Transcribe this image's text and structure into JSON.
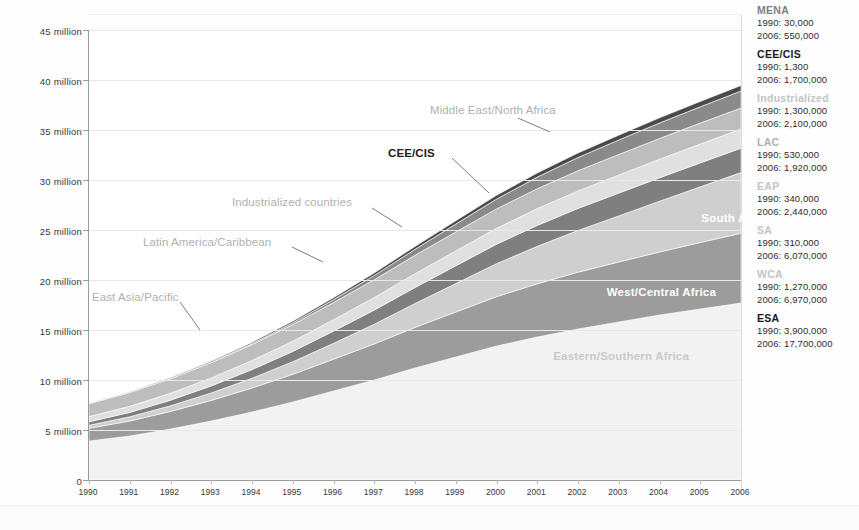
{
  "title": "",
  "chart_data": {
    "type": "area",
    "title": "",
    "xlabel": "",
    "ylabel": "",
    "stacked": true,
    "grid": true,
    "legend_position": "right",
    "ylim": [
      0,
      45000000
    ],
    "ytick_labels": [
      "0",
      "5 million",
      "10 million",
      "15 million",
      "20 million",
      "25 million",
      "30 million",
      "35 million",
      "40 million",
      "45 million"
    ],
    "ytick_values": [
      0,
      5000000,
      10000000,
      15000000,
      20000000,
      25000000,
      30000000,
      35000000,
      40000000,
      45000000
    ],
    "categories": [
      "1990",
      "1991",
      "1992",
      "1993",
      "1994",
      "1995",
      "1996",
      "1997",
      "1998",
      "1999",
      "2000",
      "2001",
      "2002",
      "2003",
      "2004",
      "2005",
      "2006"
    ],
    "series": [
      {
        "name": "Eastern/Southern Africa",
        "short": "ESA",
        "color": "#f2f2f2",
        "values": [
          3900000,
          4400000,
          5100000,
          5900000,
          6800000,
          7800000,
          8900000,
          10000000,
          11200000,
          12300000,
          13400000,
          14300000,
          15100000,
          15800000,
          16500000,
          17100000,
          17700000
        ]
      },
      {
        "name": "West/Central Africa",
        "short": "WCA",
        "color": "#9c9c9c",
        "values": [
          1270000,
          1500000,
          1760000,
          2060000,
          2400000,
          2770000,
          3180000,
          3610000,
          4060000,
          4500000,
          4930000,
          5320000,
          5680000,
          6000000,
          6300000,
          6650000,
          6970000
        ]
      },
      {
        "name": "South Asia",
        "short": "SA",
        "color": "#cfcfcf",
        "values": [
          310000,
          420000,
          560000,
          750000,
          980000,
          1260000,
          1590000,
          1970000,
          2390000,
          2840000,
          3300000,
          3750000,
          4180000,
          4610000,
          5080000,
          5570000,
          6070000
        ]
      },
      {
        "name": "East Asia/Pacific",
        "short": "EAP",
        "color": "#7f7f7f",
        "values": [
          340000,
          440000,
          560000,
          700000,
          860000,
          1030000,
          1220000,
          1410000,
          1600000,
          1780000,
          1950000,
          2090000,
          2200000,
          2280000,
          2340000,
          2390000,
          2440000
        ]
      },
      {
        "name": "Latin America/Caribbean",
        "short": "LAC",
        "color": "#e0e0e0",
        "values": [
          530000,
          610000,
          700000,
          800000,
          910000,
          1020000,
          1140000,
          1260000,
          1380000,
          1490000,
          1590000,
          1680000,
          1750000,
          1810000,
          1860000,
          1890000,
          1920000
        ]
      },
      {
        "name": "Industrialized countries",
        "short": "Industrialized",
        "color": "#bdbdbd",
        "values": [
          1300000,
          1380000,
          1450000,
          1520000,
          1590000,
          1660000,
          1720000,
          1780000,
          1840000,
          1890000,
          1940000,
          1990000,
          2020000,
          2050000,
          2070000,
          2090000,
          2100000
        ]
      },
      {
        "name": "CEE/CIS",
        "short": "CEE/CIS",
        "color": "#8a8a8a",
        "values": [
          1300,
          6000,
          20000,
          50000,
          100000,
          180000,
          290000,
          430000,
          600000,
          790000,
          980000,
          1160000,
          1320000,
          1450000,
          1550000,
          1630000,
          1700000
        ]
      },
      {
        "name": "Middle East/North Africa",
        "short": "MENA",
        "color": "#4a4a4a",
        "values": [
          30000,
          45000,
          65000,
          90000,
          120000,
          155000,
          195000,
          240000,
          285000,
          330000,
          375000,
          415000,
          455000,
          485000,
          515000,
          535000,
          550000
        ]
      }
    ]
  },
  "annotations": [
    {
      "text": "Middle East/North Africa",
      "style": "grey"
    },
    {
      "text": "CEE/CIS",
      "style": "dark"
    },
    {
      "text": "Industrialized countries",
      "style": "grey"
    },
    {
      "text": "Latin America/Caribbean",
      "style": "grey"
    },
    {
      "text": "East Asia/Pacific",
      "style": "grey"
    },
    {
      "text": "South Asia",
      "style": "white"
    },
    {
      "text": "West/Central Africa",
      "style": "white"
    },
    {
      "text": "Eastern/Southern Africa",
      "style": "ltgrey"
    }
  ],
  "legend": {
    "items": [
      {
        "name": "MENA",
        "name_color": "#808080",
        "y1990": "1990: 30,000",
        "y2006": "2006: 550,000"
      },
      {
        "name": "CEE/CIS",
        "name_color": "#1a1a1a",
        "y1990": "1990: 1,300",
        "y2006": "2006: 1,700,000"
      },
      {
        "name": "Industrialized",
        "name_color": "#c4c4c4",
        "y1990": "1990: 1,300,000",
        "y2006": "2006: 2,100,000"
      },
      {
        "name": "LAC",
        "name_color": "#b0b0b0",
        "y1990": "1990: 530,000",
        "y2006": "2006: 1,920,000"
      },
      {
        "name": "EAP",
        "name_color": "#c4c4c4",
        "y1990": "1990: 340,000",
        "y2006": "2006: 2,440,000"
      },
      {
        "name": "SA",
        "name_color": "#c4c4c4",
        "y1990": "1990: 310,000",
        "y2006": "2006: 6,070,000"
      },
      {
        "name": "WCA",
        "name_color": "#c4c4c4",
        "y1990": "1990: 1,270,000",
        "y2006": "2006: 6,970,000"
      },
      {
        "name": "ESA",
        "name_color": "#1a1a1a",
        "y1990": "1990: 3,900,000",
        "y2006": "2006: 17,700,000"
      }
    ]
  }
}
